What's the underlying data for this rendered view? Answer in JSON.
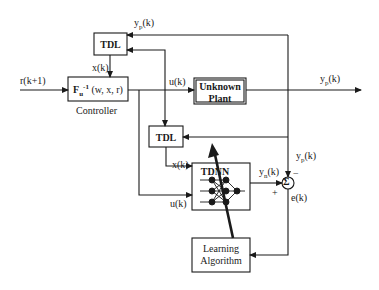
{
  "diagram": {
    "type": "block-diagram",
    "colors": {
      "ink": "#1a1a1a",
      "background": "#ffffff"
    },
    "blocks": {
      "tdl_top": {
        "label": "TDL"
      },
      "controller": {
        "label_main": "F",
        "label_sub": "u",
        "label_sup": "-1",
        "label_args": "(w, x, r)",
        "caption": "Controller"
      },
      "plant": {
        "line1": "Unknown",
        "line2": "Plant"
      },
      "tdl_bottom": {
        "label": "TDL"
      },
      "tdnn": {
        "label": "TDNN"
      },
      "learning": {
        "line1": "Learning",
        "line2": "Algorithm"
      },
      "sum": {
        "symbol": "Σ"
      }
    },
    "signals": {
      "reference": "r(k+1)",
      "state_top": "x(k)",
      "control_top": "u(k)",
      "plant_output_main": "y",
      "plant_output_sub": "p",
      "plant_output_arg": "(k)",
      "feedback_top_main": "y",
      "feedback_top_sub": "p",
      "feedback_top_arg": "(k)",
      "state_bottom": "x(k)",
      "control_bottom": "u(k)",
      "nn_output_main": "y",
      "nn_output_sub": "n",
      "nn_output_arg": "(k)",
      "sum_minus_main": "y",
      "sum_minus_sub": "p",
      "sum_minus_arg": "(k)",
      "sum_plus_sign": "+",
      "sum_minus_sign": "−",
      "error": "e(k)"
    }
  }
}
